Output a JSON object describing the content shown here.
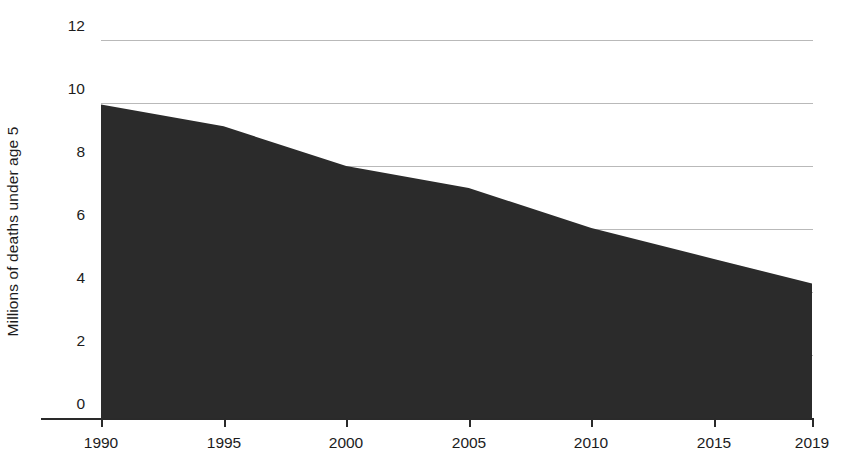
{
  "chart_data": {
    "type": "area",
    "title": "",
    "xlabel": "",
    "ylabel": "Millions of deaths under age 5",
    "x": [
      1990,
      1995,
      2000,
      2005,
      2010,
      2015,
      2019
    ],
    "values": [
      9.95,
      9.26,
      8.0,
      7.3,
      6.03,
      5.05,
      4.27
    ],
    "series": [
      {
        "name": "Deaths under age 5",
        "values": [
          9.95,
          9.26,
          8.0,
          7.3,
          6.03,
          5.05,
          4.27
        ]
      }
    ],
    "xlim": [
      1990,
      2019
    ],
    "ylim": [
      0,
      12
    ],
    "xticks": [
      1990,
      1995,
      2000,
      2005,
      2010,
      2015,
      2019
    ],
    "xtick_labels": [
      "1990",
      "1995",
      "2000",
      "2005",
      "2010",
      "2015",
      "2019"
    ],
    "yticks": [
      0,
      2,
      4,
      6,
      8,
      10,
      12
    ],
    "ytick_labels": [
      "0",
      "2",
      "4",
      "6",
      "8",
      "10",
      "12"
    ],
    "grid": true,
    "legend": false,
    "legend_position": "none",
    "colors": {
      "area_fill": "#2b2b2b",
      "gridline": "#b9b9b9",
      "axis": "#2a2a2a",
      "text": "#1c1c1c",
      "background": "#ffffff"
    }
  },
  "axis": {
    "y_title": "Millions of deaths under age 5"
  }
}
